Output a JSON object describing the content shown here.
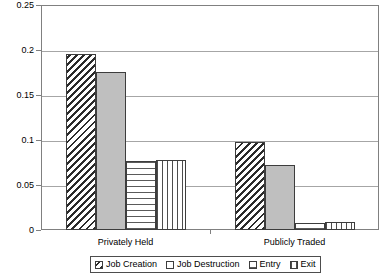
{
  "chart_data": {
    "type": "bar",
    "title": "",
    "xlabel": "",
    "ylabel": "",
    "categories": [
      "Privately Held",
      "Publicly Traded"
    ],
    "series": [
      {
        "name": "Job Creation",
        "pattern": "diagonal-hatch",
        "values": [
          0.196,
          0.098
        ]
      },
      {
        "name": "Job Destruction",
        "pattern": "solid-gray",
        "values": [
          0.176,
          0.072
        ]
      },
      {
        "name": "Entry",
        "pattern": "grid-crosshatch",
        "values": [
          0.077,
          0.008
        ]
      },
      {
        "name": "Exit",
        "pattern": "vertical-lines",
        "values": [
          0.078,
          0.009
        ]
      }
    ],
    "ylim": [
      0,
      0.25
    ],
    "ytick_labels": [
      "0",
      "0.05",
      "0.1",
      "0.15",
      "0.2",
      "0.25"
    ],
    "ytick_values": [
      0,
      0.05,
      0.1,
      0.15,
      0.2,
      0.25
    ],
    "grid": true,
    "legend_position": "bottom"
  },
  "legend": {
    "items": [
      {
        "label": "Job Creation"
      },
      {
        "label": "Job Destruction"
      },
      {
        "label": "Entry"
      },
      {
        "label": "Exit"
      }
    ]
  },
  "colors": {
    "frame": "#808080",
    "gridline": "#a6a6a6",
    "bar_outline": "#3d3d3d",
    "solid_fill": "#bfbfbf",
    "background": "#ffffff"
  }
}
